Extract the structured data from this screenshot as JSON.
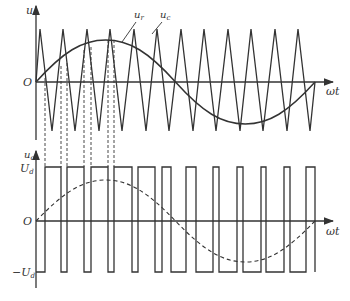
{
  "diagram": {
    "type": "SPWM waveform",
    "top": {
      "y_axis_label": "u",
      "origin_label": "O",
      "x_axis_label": "ωt",
      "callouts": [
        {
          "label": "u",
          "sub": "r",
          "target": "sine reference"
        },
        {
          "label": "u",
          "sub": "c",
          "target": "triangular carrier"
        }
      ]
    },
    "bottom": {
      "y_axis_label": "u",
      "y_axis_sub": "o",
      "pos_level_label": "U",
      "pos_level_sub": "d",
      "neg_level_label": "−U",
      "neg_level_sub": "d",
      "origin_label": "O",
      "x_axis_label": "ωt"
    },
    "colors": {
      "stroke": "#333333",
      "background": "#ffffff"
    }
  }
}
